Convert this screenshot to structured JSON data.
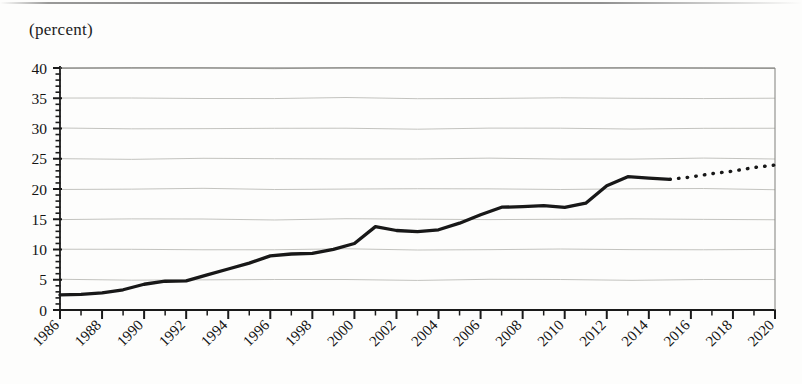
{
  "figure": {
    "unit_label": "(percent)",
    "axis_color": "#1a1a1a",
    "grid_color": "#b9b9b4",
    "series_color": "#181818"
  },
  "chart_data": {
    "type": "line",
    "title": "",
    "subtitle": "",
    "xlabel": "",
    "ylabel": "(percent)",
    "ylim": [
      0,
      40
    ],
    "xlim": [
      1986,
      2020
    ],
    "grid": true,
    "grid_axis": "y",
    "legend": false,
    "legend_position": "none",
    "ytick_labels": [
      "0",
      "5",
      "10",
      "15",
      "20",
      "25",
      "30",
      "35",
      "40"
    ],
    "ytick_values": [
      0,
      5,
      10,
      15,
      20,
      25,
      30,
      35,
      40
    ],
    "yminor_tick_step": 1,
    "xtick_labels": [
      "1986",
      "1988",
      "1990",
      "1992",
      "1994",
      "1996",
      "1998",
      "2000",
      "2002",
      "2004",
      "2006",
      "2008",
      "2010",
      "2012",
      "2014",
      "2016",
      "2018",
      "2020"
    ],
    "xtick_values": [
      1986,
      1988,
      1990,
      1992,
      1994,
      1996,
      1998,
      2000,
      2002,
      2004,
      2006,
      2008,
      2010,
      2012,
      2014,
      2016,
      2018,
      2020
    ],
    "xtick_label_rotation": -45,
    "xminor_tick_step": 1,
    "series": [
      {
        "name": "actual",
        "style": "solid",
        "x": [
          1986,
          1987,
          1988,
          1989,
          1990,
          1991,
          1992,
          1993,
          1994,
          1995,
          1996,
          1997,
          1998,
          1999,
          2000,
          2001,
          2002,
          2003,
          2004,
          2005,
          2006,
          2007,
          2008,
          2009,
          2010,
          2011,
          2012,
          2013,
          2014,
          2015
        ],
        "values": [
          2.5,
          2.6,
          2.8,
          3.4,
          4.2,
          4.8,
          4.8,
          5.8,
          6.8,
          7.7,
          9.0,
          9.2,
          9.4,
          10.0,
          11.0,
          13.8,
          13.1,
          13.0,
          13.2,
          14.4,
          15.7,
          17.0,
          17.1,
          17.2,
          17.0,
          17.6,
          20.6,
          22.0,
          21.8,
          21.6
        ]
      },
      {
        "name": "projection",
        "style": "dotted",
        "x": [
          2015,
          2016,
          2017,
          2018,
          2019,
          2020
        ],
        "values": [
          21.6,
          22.0,
          22.5,
          23.0,
          23.5,
          24.0
        ]
      }
    ]
  }
}
